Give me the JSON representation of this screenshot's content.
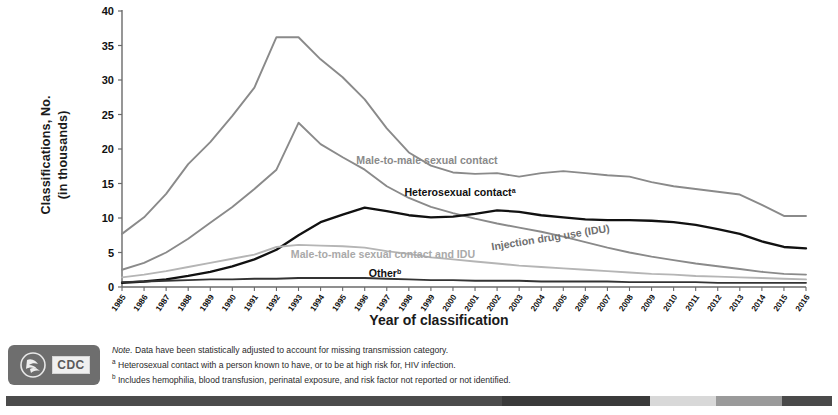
{
  "chart_data": {
    "type": "line",
    "title": "",
    "xlabel": "Year of classification",
    "ylabel": "Classifications, No. (in thousands)",
    "ylabel_line1": "Classifications,  No.",
    "ylabel_line2": "(in thousands)",
    "ylim": [
      0,
      40
    ],
    "yticks": [
      0,
      5,
      10,
      15,
      20,
      25,
      30,
      35,
      40
    ],
    "grid": false,
    "legend": "inline-labels",
    "categories": [
      1985,
      1986,
      1987,
      1988,
      1989,
      1990,
      1991,
      1992,
      1993,
      1994,
      1995,
      1996,
      1997,
      1998,
      1999,
      2000,
      2001,
      2002,
      2003,
      2004,
      2005,
      2006,
      2007,
      2008,
      2009,
      2010,
      2011,
      2012,
      2013,
      2014,
      2015,
      2016
    ],
    "series": [
      {
        "name": "Male-to-male sexual contact",
        "color": "#8a8a8a",
        "values": [
          7.7,
          10.1,
          13.5,
          17.8,
          21.0,
          24.8,
          28.9,
          36.2,
          36.2,
          33.0,
          30.4,
          27.2,
          23.0,
          19.5,
          17.6,
          16.6,
          16.4,
          16.5,
          16.0,
          16.5,
          16.8,
          16.5,
          16.2,
          16.0,
          15.2,
          14.6,
          14.2,
          13.8,
          13.4,
          11.9,
          10.3,
          10.3
        ]
      },
      {
        "name": "Injection drug use (IDU)",
        "color": "#8a8a8a",
        "values": [
          2.5,
          3.5,
          5.0,
          7.0,
          9.3,
          11.6,
          14.2,
          17.0,
          23.8,
          20.7,
          18.8,
          17.0,
          14.6,
          12.9,
          11.6,
          10.7,
          9.9,
          9.2,
          8.6,
          8.0,
          7.3,
          6.5,
          5.7,
          5.0,
          4.4,
          3.9,
          3.4,
          3.0,
          2.6,
          2.2,
          1.9,
          1.8
        ]
      },
      {
        "name": "Heterosexual contact",
        "footnote": "a",
        "color": "#111111",
        "values": [
          0.6,
          0.8,
          1.1,
          1.6,
          2.2,
          3.0,
          4.0,
          5.4,
          7.5,
          9.4,
          10.5,
          11.5,
          11.0,
          10.4,
          10.1,
          10.2,
          10.6,
          11.1,
          10.9,
          10.4,
          10.1,
          9.8,
          9.7,
          9.7,
          9.6,
          9.4,
          9.0,
          8.4,
          7.7,
          6.6,
          5.8,
          5.6
        ]
      },
      {
        "name": "Male-to-male sexual contact and IDU",
        "color": "#b5b5b5",
        "values": [
          1.4,
          1.8,
          2.3,
          2.9,
          3.5,
          4.1,
          4.7,
          5.8,
          6.1,
          6.0,
          5.9,
          5.7,
          5.2,
          4.8,
          4.3,
          4.0,
          3.7,
          3.4,
          3.1,
          2.9,
          2.7,
          2.5,
          2.3,
          2.1,
          1.9,
          1.8,
          1.6,
          1.5,
          1.4,
          1.3,
          1.2,
          1.1
        ]
      },
      {
        "name": "Other",
        "footnote": "b",
        "color": "#333333",
        "values": [
          0.7,
          0.8,
          0.9,
          1.0,
          1.1,
          1.1,
          1.2,
          1.2,
          1.3,
          1.3,
          1.3,
          1.3,
          1.2,
          1.1,
          1.0,
          1.0,
          0.9,
          0.9,
          0.9,
          0.8,
          0.8,
          0.8,
          0.8,
          0.7,
          0.7,
          0.7,
          0.7,
          0.6,
          0.6,
          0.6,
          0.6,
          0.6
        ]
      }
    ],
    "inline_labels": [
      {
        "text": "Male-to-male sexual contact",
        "x": 427,
        "y": 164,
        "color": "#8a8a8a",
        "rotate": 0
      },
      {
        "text": "Heterosexual contact",
        "sup": "a",
        "x": 460,
        "y": 196,
        "color": "#111111",
        "rotate": 0
      },
      {
        "text": "Injection drug use (IDU)",
        "x": 551,
        "y": 241,
        "color": "#6f6f6f",
        "rotate": -9
      },
      {
        "text": "Male-to-male sexual contact and IDU",
        "x": 383,
        "y": 258,
        "color": "#a9a9a9",
        "rotate": 0
      },
      {
        "text": "Other",
        "sup": "b",
        "x": 385,
        "y": 277,
        "color": "#111111",
        "rotate": 0
      }
    ]
  },
  "footnotes": {
    "note_lead": "Note.",
    "note_text": " Data have been statistically adjusted to account for missing transmission category.",
    "a_mark": "a",
    "a_text": " Heterosexual contact with a person known to have, or to be at high risk for, HIV infection.",
    "b_mark": "b",
    "b_text": " Includes hemophilia, blood transfusion, perinatal exposure, and risk factor not reported or not identified."
  },
  "logo": {
    "cdc_text": "CDC",
    "seal_name": "hhs-seal-icon"
  },
  "bottom_bar": {
    "segments": [
      {
        "color": "#4c4c4c",
        "flex": 60
      },
      {
        "color": "#3a3a3a",
        "flex": 18
      },
      {
        "color": "#d8d8d8",
        "flex": 8
      },
      {
        "color": "#9a9a9a",
        "flex": 8
      },
      {
        "color": "#4a4a4a",
        "flex": 6
      }
    ]
  }
}
